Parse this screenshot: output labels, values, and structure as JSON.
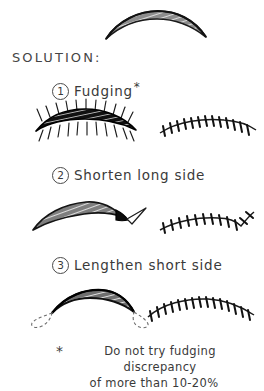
{
  "document": {
    "heading": "SOLUTION:",
    "background_color": "#ffffff",
    "ink_color": "#2b2b2b"
  },
  "steps": [
    {
      "number": "1",
      "label": "Fudging",
      "footnote_marker": "*"
    },
    {
      "number": "2",
      "label": "Shorten long side",
      "footnote_marker": ""
    },
    {
      "number": "3",
      "label": "Lengthen short side",
      "footnote_marker": ""
    }
  ],
  "footnote": {
    "marker": "*",
    "line1": "Do not try fudging discrepancy",
    "line2": "of more than 10-20%"
  },
  "figures": {
    "top_excision": {
      "name": "crescent-excision-unequal-sides",
      "description": "lens shaped crescent excision with hatched shading"
    },
    "step1_before": {
      "name": "crescent-with-radiating-suture-marks",
      "description": "crescent excision with radiating tick marks above and below"
    },
    "step1_after": {
      "name": "sutured-closure-line-even",
      "description": "gently curved sutured closure with cross stitches"
    },
    "step2_before": {
      "name": "crescent-with-burow-triangle",
      "description": "crescent excision with triangular wedge removed at right end"
    },
    "step2_after": {
      "name": "sutured-closure-line-with-hook",
      "description": "sutured closure line angling upward at right end"
    },
    "step3_before": {
      "name": "crescent-with-dashed-extensions",
      "description": "crescent excision with dashed loop extensions at both ends"
    },
    "step3_after": {
      "name": "sutured-closure-line-extended",
      "description": "longer sutured closure line with stitches across full arc"
    }
  }
}
